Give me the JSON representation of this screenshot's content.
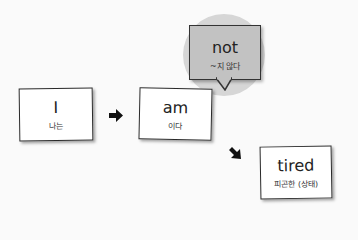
{
  "diagram": {
    "nodes": [
      {
        "id": "subject",
        "word": "I",
        "meaning": "나는"
      },
      {
        "id": "verb",
        "word": "am",
        "meaning": "이다"
      },
      {
        "id": "complement",
        "word": "tired",
        "meaning": "피곤한 (상태)"
      }
    ],
    "callout": {
      "word": "not",
      "meaning": "~지 않다",
      "attached_to": "verb"
    },
    "arrows": [
      {
        "from": "subject",
        "to": "verb",
        "direction": "right"
      },
      {
        "from": "verb",
        "to": "complement",
        "direction": "down-right"
      }
    ],
    "colors": {
      "callout_fill": "#c2c2c2",
      "highlight_circle": "#d6d6d6",
      "card_border": "#2a2a2a"
    }
  }
}
